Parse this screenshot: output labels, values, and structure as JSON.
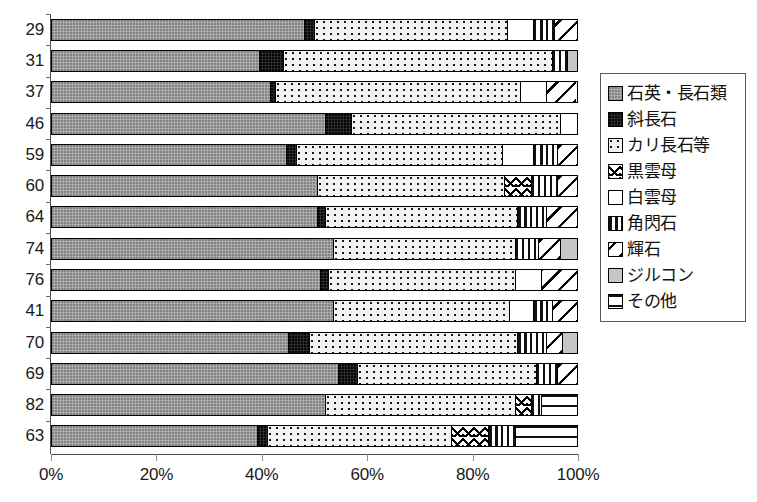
{
  "chart_data": {
    "type": "bar",
    "orientation": "horizontal",
    "stacked": true,
    "normalized": true,
    "title": "",
    "xlabel": "",
    "ylabel": "",
    "xlim": [
      0,
      100
    ],
    "grid": false,
    "legend_position": "right",
    "x_ticks": [
      "0%",
      "20%",
      "40%",
      "60%",
      "80%",
      "100%"
    ],
    "x_tick_values": [
      0,
      20,
      40,
      60,
      80,
      100
    ],
    "categories": [
      "29",
      "31",
      "37",
      "46",
      "59",
      "60",
      "64",
      "74",
      "76",
      "41",
      "70",
      "69",
      "82",
      "63"
    ],
    "series": [
      {
        "name": "石英・長石類",
        "key": "qtz",
        "pattern": "solid-gray",
        "values": [
          48.0,
          39.5,
          41.5,
          52.0,
          44.5,
          50.5,
          50.5,
          53.5,
          51.0,
          53.5,
          45.0,
          54.5,
          52.0,
          39.0
        ]
      },
      {
        "name": "斜長石",
        "key": "plag",
        "pattern": "solid-black",
        "values": [
          2.0,
          4.5,
          1.0,
          5.0,
          2.0,
          0.0,
          1.5,
          0.0,
          1.5,
          0.0,
          4.0,
          3.5,
          0.0,
          2.0
        ]
      },
      {
        "name": "カリ長石等",
        "key": "kfs",
        "pattern": "dotted",
        "values": [
          36.5,
          51.0,
          46.5,
          39.5,
          39.0,
          35.5,
          36.5,
          34.5,
          35.5,
          33.5,
          39.5,
          34.0,
          36.0,
          35.0
        ]
      },
      {
        "name": "黒雲母",
        "key": "biot",
        "pattern": "wave-hatch",
        "values": [
          0.0,
          0.0,
          0.0,
          0.0,
          0.0,
          5.0,
          0.0,
          0.0,
          0.0,
          0.0,
          0.0,
          0.0,
          3.0,
          7.0
        ]
      },
      {
        "name": "白雲母",
        "key": "musc",
        "pattern": "white",
        "values": [
          5.0,
          0.0,
          5.0,
          3.5,
          6.0,
          0.0,
          0.0,
          0.0,
          5.0,
          4.5,
          0.0,
          0.0,
          0.0,
          0.0
        ]
      },
      {
        "name": "角閃石",
        "key": "horn",
        "pattern": "vertical-bars",
        "values": [
          4.0,
          3.0,
          0.0,
          0.0,
          4.5,
          5.0,
          5.5,
          4.5,
          0.0,
          3.5,
          5.5,
          4.0,
          2.0,
          5.0
        ]
      },
      {
        "name": "輝石",
        "key": "pyro",
        "pattern": "diagonal-stripe",
        "values": [
          4.5,
          0.0,
          5.5,
          0.0,
          4.0,
          4.0,
          6.0,
          4.0,
          7.0,
          5.0,
          3.0,
          4.0,
          0.0,
          0.0
        ]
      },
      {
        "name": "ジルコン",
        "key": "zirc",
        "pattern": "light-gray",
        "values": [
          0.0,
          2.0,
          0.0,
          0.0,
          0.0,
          0.0,
          0.0,
          3.5,
          0.0,
          0.0,
          3.0,
          0.0,
          0.0,
          0.0
        ]
      },
      {
        "name": "その他",
        "key": "other",
        "pattern": "dashed-white",
        "values": [
          0.0,
          0.0,
          0.0,
          0.0,
          0.0,
          0.0,
          0.0,
          0.0,
          0.0,
          0.0,
          0.0,
          0.0,
          7.0,
          12.0
        ]
      }
    ]
  },
  "legend": {
    "items": [
      {
        "label": "石英・長石類",
        "key": "qtz"
      },
      {
        "label": "斜長石",
        "key": "plag"
      },
      {
        "label": "カリ長石等",
        "key": "kfs"
      },
      {
        "label": "黒雲母",
        "key": "biot"
      },
      {
        "label": "白雲母",
        "key": "musc"
      },
      {
        "label": "角閃石",
        "key": "horn"
      },
      {
        "label": "輝石",
        "key": "pyro"
      },
      {
        "label": "ジルコン",
        "key": "zirc"
      },
      {
        "label": "その他",
        "key": "other"
      }
    ]
  }
}
